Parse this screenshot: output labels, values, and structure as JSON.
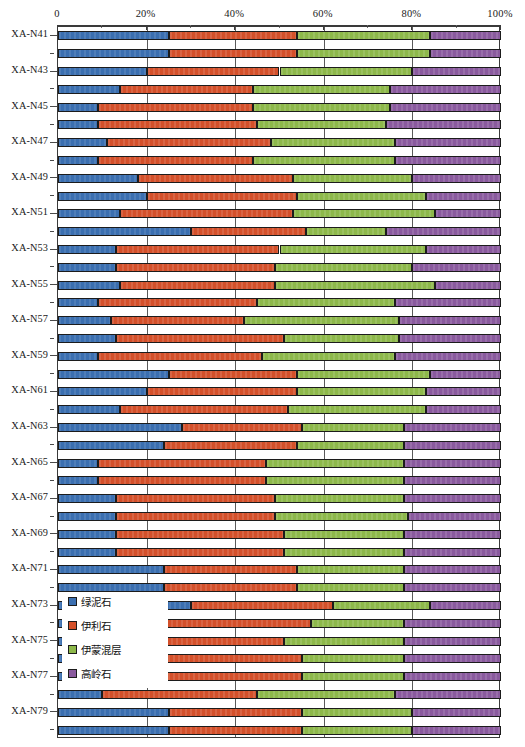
{
  "chart_data": {
    "type": "bar",
    "orientation": "horizontal",
    "stacked": true,
    "normalized_percent": true,
    "title": "",
    "xlabel": "",
    "ylabel": "",
    "xlim": [
      0,
      100
    ],
    "grid": true,
    "legend_position": "inside-bottom-left",
    "axis_position": "top",
    "xticks": [
      0,
      20,
      40,
      60,
      80,
      100
    ],
    "xtick_labels": [
      "0",
      "20%",
      "40%",
      "60%",
      "80%",
      "100%"
    ],
    "xminor_ticks": [
      10,
      30,
      50,
      70,
      90
    ],
    "series": [
      {
        "name": "绿泥石",
        "color": "#3b6fb0"
      },
      {
        "name": "伊利石",
        "color": "#d4502a"
      },
      {
        "name": "伊蒙混层",
        "color": "#8db84a"
      },
      {
        "name": "高岭石",
        "color": "#8a5a9e"
      }
    ],
    "categories": [
      "XA-N41",
      "XA-N42",
      "XA-N43",
      "XA-N44",
      "XA-N45",
      "XA-N46",
      "XA-N47",
      "XA-N48",
      "XA-N49",
      "XA-N50",
      "XA-N51",
      "XA-N52",
      "XA-N53",
      "XA-N54",
      "XA-N55",
      "XA-N56",
      "XA-N57",
      "XA-N58",
      "XA-N59",
      "XA-N60",
      "XA-N61",
      "XA-N62",
      "XA-N63",
      "XA-N64",
      "XA-N65",
      "XA-N66",
      "XA-N67",
      "XA-N68",
      "XA-N69",
      "XA-N70",
      "XA-N71",
      "XA-N72",
      "XA-N73",
      "XA-N74",
      "XA-N75",
      "XA-N76",
      "XA-N77",
      "XA-N78",
      "XA-N79",
      "XA-N80"
    ],
    "visible_tick_labels": [
      "XA-N41",
      "XA-N43",
      "XA-N45",
      "XA-N47",
      "XA-N49",
      "XA-N51",
      "XA-N53",
      "XA-N55",
      "XA-N57",
      "XA-N59",
      "XA-N61",
      "XA-N63",
      "XA-N65",
      "XA-N67",
      "XA-N69",
      "XA-N71",
      "XA-N73",
      "XA-N75",
      "XA-N77",
      "XA-N79"
    ],
    "rows": [
      {
        "label": "XA-N41",
        "values": [
          25,
          29,
          30,
          16
        ]
      },
      {
        "label": "XA-N42",
        "values": [
          25,
          29,
          30,
          16
        ]
      },
      {
        "label": "XA-N43",
        "values": [
          20,
          30,
          30,
          20
        ]
      },
      {
        "label": "XA-N44",
        "values": [
          14,
          30,
          31,
          25
        ]
      },
      {
        "label": "XA-N45",
        "values": [
          9,
          35,
          31,
          25
        ]
      },
      {
        "label": "XA-N46",
        "values": [
          9,
          36,
          29,
          26
        ]
      },
      {
        "label": "XA-N47",
        "values": [
          11,
          37,
          28,
          24
        ]
      },
      {
        "label": "XA-N48",
        "values": [
          9,
          35,
          32,
          24
        ]
      },
      {
        "label": "XA-N49",
        "values": [
          18,
          35,
          27,
          20
        ]
      },
      {
        "label": "XA-N50",
        "values": [
          20,
          34,
          29,
          17
        ]
      },
      {
        "label": "XA-N51",
        "values": [
          14,
          39,
          32,
          15
        ]
      },
      {
        "label": "XA-N52",
        "values": [
          30,
          26,
          18,
          26
        ]
      },
      {
        "label": "XA-N53",
        "values": [
          13,
          37,
          33,
          17
        ]
      },
      {
        "label": "XA-N54",
        "values": [
          13,
          36,
          31,
          20
        ]
      },
      {
        "label": "XA-N55",
        "values": [
          14,
          35,
          36,
          15
        ]
      },
      {
        "label": "XA-N56",
        "values": [
          9,
          36,
          31,
          24
        ]
      },
      {
        "label": "XA-N57",
        "values": [
          12,
          30,
          35,
          23
        ]
      },
      {
        "label": "XA-N58",
        "values": [
          13,
          38,
          26,
          23
        ]
      },
      {
        "label": "XA-N59",
        "values": [
          9,
          37,
          30,
          24
        ]
      },
      {
        "label": "XA-N60",
        "values": [
          25,
          29,
          30,
          16
        ]
      },
      {
        "label": "XA-N61",
        "values": [
          20,
          34,
          29,
          17
        ]
      },
      {
        "label": "XA-N62",
        "values": [
          14,
          38,
          31,
          17
        ]
      },
      {
        "label": "XA-N63",
        "values": [
          28,
          27,
          23,
          22
        ]
      },
      {
        "label": "XA-N64",
        "values": [
          24,
          30,
          24,
          22
        ]
      },
      {
        "label": "XA-N65",
        "values": [
          9,
          38,
          31,
          22
        ]
      },
      {
        "label": "XA-N66",
        "values": [
          9,
          38,
          31,
          22
        ]
      },
      {
        "label": "XA-N67",
        "values": [
          13,
          36,
          29,
          22
        ]
      },
      {
        "label": "XA-N68",
        "values": [
          13,
          36,
          30,
          21
        ]
      },
      {
        "label": "XA-N69",
        "values": [
          13,
          38,
          27,
          22
        ]
      },
      {
        "label": "XA-N70",
        "values": [
          13,
          38,
          27,
          22
        ]
      },
      {
        "label": "XA-N71",
        "values": [
          24,
          30,
          24,
          22
        ]
      },
      {
        "label": "XA-N72",
        "values": [
          24,
          30,
          24,
          22
        ]
      },
      {
        "label": "XA-N73",
        "values": [
          30,
          32,
          22,
          16
        ]
      },
      {
        "label": "XA-N74",
        "values": [
          22,
          35,
          21,
          22
        ]
      },
      {
        "label": "XA-N75",
        "values": [
          14,
          37,
          27,
          22
        ]
      },
      {
        "label": "XA-N76",
        "values": [
          20,
          35,
          23,
          22
        ]
      },
      {
        "label": "XA-N77",
        "values": [
          20,
          35,
          23,
          22
        ]
      },
      {
        "label": "XA-N78",
        "values": [
          10,
          35,
          31,
          24
        ]
      },
      {
        "label": "XA-N79",
        "values": [
          25,
          30,
          25,
          20
        ]
      },
      {
        "label": "XA-N80",
        "values": [
          25,
          30,
          25,
          20
        ]
      }
    ],
    "legend_entries": [
      {
        "label": "绿泥石",
        "color": "#3b6fb0"
      },
      {
        "label": "伊利石",
        "color": "#d4502a"
      },
      {
        "label": "伊蒙混层",
        "color": "#8db84a"
      },
      {
        "label": "高岭石",
        "color": "#8a5a9e"
      }
    ]
  }
}
